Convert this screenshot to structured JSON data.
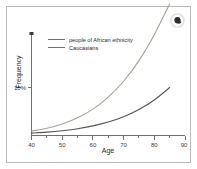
{
  "figure": {
    "background_color": "#ffffff",
    "frame_color": "#b9b9b9"
  },
  "corner_icon": {
    "name": "dark-circle-badge-icon",
    "color": "#2b2b2b",
    "halo_color": "#dcdcdc"
  },
  "chart_data": {
    "type": "line",
    "title": "",
    "xlabel": "Age",
    "ylabel": "Frequency",
    "xlim": [
      40,
      90
    ],
    "ylim": [
      0,
      30
    ],
    "xticks": [
      40,
      50,
      60,
      70,
      80,
      90
    ],
    "xtick_labels": [
      "40",
      "50",
      "60",
      "70",
      "80",
      "90"
    ],
    "yticks": [
      10
    ],
    "ytick_labels": [
      "10%"
    ],
    "grid": false,
    "legend_position": "upper-left-inside",
    "x": [
      40,
      45,
      50,
      55,
      60,
      65,
      70,
      75,
      80,
      85
    ],
    "series": [
      {
        "name": "people of African ethnicity",
        "color": "#a9a093",
        "line_width": 1.1,
        "values": [
          0.9,
          1.5,
          2.4,
          3.7,
          5.5,
          8.0,
          11.3,
          15.6,
          21.0,
          27.4
        ]
      },
      {
        "name": "Caucasians",
        "color": "#555555",
        "line_width": 1.1,
        "values": [
          0.5,
          0.7,
          1.0,
          1.4,
          2.0,
          2.8,
          3.9,
          5.4,
          7.4,
          10.0
        ]
      }
    ]
  },
  "legend": {
    "entries": [
      {
        "label": "people of African ethnicity",
        "swatch_color": "#a9a093"
      },
      {
        "label": "Caucasians",
        "swatch_color": "#555555"
      }
    ]
  },
  "axes": {
    "x_title": "Age",
    "y_title": "Frequency",
    "x_tick_labels": [
      "40",
      "50",
      "60",
      "70",
      "80",
      "90"
    ],
    "y_tick_labels": [
      "10%"
    ]
  }
}
